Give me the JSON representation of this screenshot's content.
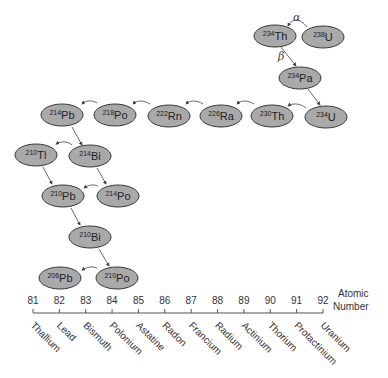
{
  "nuclides": [
    {
      "id": "th234",
      "mass": "234",
      "symbol": "Th",
      "cx": 275,
      "cy": 36
    },
    {
      "id": "u238",
      "mass": "238",
      "symbol": "U",
      "cx": 323,
      "cy": 37
    },
    {
      "id": "pa234",
      "mass": "234",
      "symbol": "Pa",
      "cx": 300,
      "cy": 78
    },
    {
      "id": "u234",
      "mass": "234",
      "symbol": "U",
      "cx": 326,
      "cy": 117
    },
    {
      "id": "th230",
      "mass": "230",
      "symbol": "Th",
      "cx": 272,
      "cy": 116
    },
    {
      "id": "ra226",
      "mass": "226",
      "symbol": "Ra",
      "cx": 221,
      "cy": 116
    },
    {
      "id": "rn222",
      "mass": "222",
      "symbol": "Rn",
      "cx": 169,
      "cy": 116
    },
    {
      "id": "po218",
      "mass": "218",
      "symbol": "Po",
      "cx": 115,
      "cy": 115
    },
    {
      "id": "pb214",
      "mass": "214",
      "symbol": "Pb",
      "cx": 62,
      "cy": 115
    },
    {
      "id": "tl210",
      "mass": "210",
      "symbol": "Tl",
      "cx": 36,
      "cy": 155
    },
    {
      "id": "bi214",
      "mass": "214",
      "symbol": "Bi",
      "cx": 90,
      "cy": 156
    },
    {
      "id": "pb210",
      "mass": "210",
      "symbol": "Pb",
      "cx": 63,
      "cy": 196
    },
    {
      "id": "po214",
      "mass": "214",
      "symbol": "Po",
      "cx": 118,
      "cy": 196
    },
    {
      "id": "bi210",
      "mass": "210",
      "symbol": "Bi",
      "cx": 90,
      "cy": 237
    },
    {
      "id": "pb206",
      "mass": "206",
      "symbol": "Pb",
      "cx": 60,
      "cy": 278
    },
    {
      "id": "po210",
      "mass": "210",
      "symbol": "Po",
      "cx": 117,
      "cy": 278
    }
  ],
  "decay_labels": {
    "alpha": "α",
    "beta": "β"
  },
  "axis": {
    "title_line1": "Atomic",
    "title_line2": "Number",
    "ticks": [
      {
        "number": "81",
        "element": "Thallium"
      },
      {
        "number": "82",
        "element": "Lead"
      },
      {
        "number": "83",
        "element": "Bismuth"
      },
      {
        "number": "84",
        "element": "Polonium"
      },
      {
        "number": "85",
        "element": "Astatine"
      },
      {
        "number": "86",
        "element": "Radon"
      },
      {
        "number": "87",
        "element": "Francium"
      },
      {
        "number": "88",
        "element": "Radium"
      },
      {
        "number": "89",
        "element": "Actinium"
      },
      {
        "number": "90",
        "element": "Thorium"
      },
      {
        "number": "91",
        "element": "Protactinium"
      },
      {
        "number": "92",
        "element": "Uranium"
      }
    ]
  }
}
